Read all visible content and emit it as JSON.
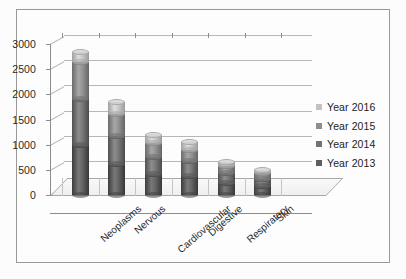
{
  "chart_data": {
    "type": "bar",
    "subtype": "stacked-cylinder-3d",
    "title": "",
    "xlabel": "",
    "ylabel": "",
    "ylim": [
      0,
      3000
    ],
    "ytick_step": 500,
    "yticks": [
      "3000",
      "2500",
      "2000",
      "1500",
      "1000",
      "500",
      "0"
    ],
    "grid": true,
    "legend_position": "right",
    "categories": [
      "Neoplasms",
      "Nervous",
      "Cardiovascular",
      "Digestive",
      "Respiratory",
      "Skin"
    ],
    "series": [
      {
        "name": "Year 2013",
        "color": "#5f5f5f",
        "values": [
          1000,
          620,
          420,
          380,
          230,
          170
        ]
      },
      {
        "name": "Year 2014",
        "color": "#737373",
        "values": [
          900,
          560,
          330,
          290,
          200,
          150
        ]
      },
      {
        "name": "Year 2015",
        "color": "#8e8e8e",
        "values": [
          750,
          430,
          280,
          230,
          140,
          110
        ]
      },
      {
        "name": "Year 2016",
        "color": "#c4c4c4",
        "values": [
          200,
          240,
          170,
          150,
          80,
          70
        ]
      }
    ],
    "totals": [
      2850,
      1850,
      1200,
      1050,
      650,
      500
    ]
  },
  "legend": {
    "entries": [
      {
        "label": "Year 2016",
        "color": "#c4c4c4"
      },
      {
        "label": "Year 2015",
        "color": "#8e8e8e"
      },
      {
        "label": "Year 2014",
        "color": "#737373"
      },
      {
        "label": "Year 2013",
        "color": "#5f5f5f"
      }
    ]
  },
  "colors": {
    "background": "#ffffff",
    "frame": "#9a9a9a",
    "axis": "#8d8d8d",
    "gridline": "#b9b9b9",
    "text": "#222222"
  }
}
